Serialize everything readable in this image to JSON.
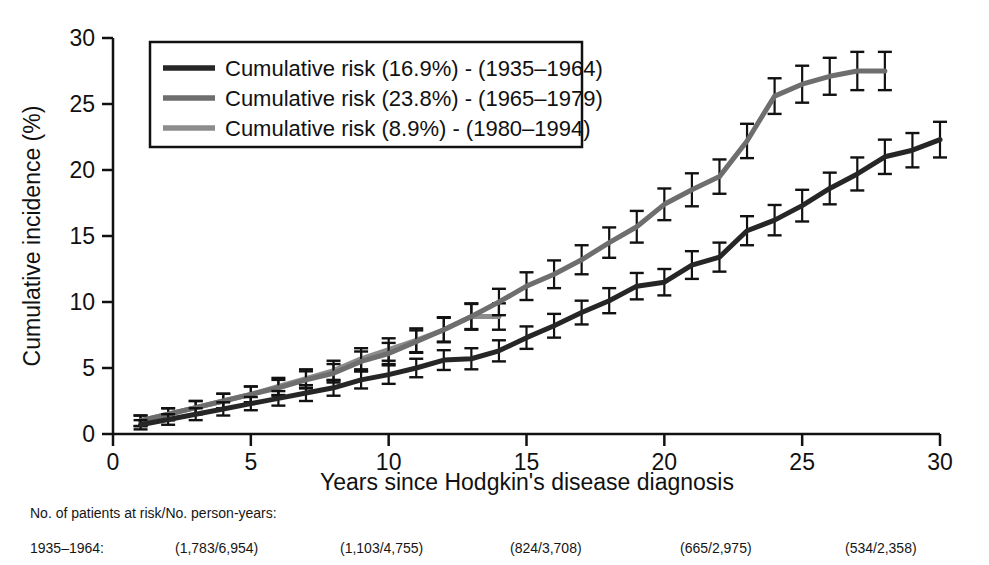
{
  "chart_data": {
    "type": "line",
    "title": "",
    "xlabel": "Years since Hodgkin's disease diagnosis",
    "ylabel": "Cumulative incidence (%)",
    "xlim": [
      0,
      30
    ],
    "ylim": [
      0,
      30
    ],
    "xticks": [
      0,
      5,
      10,
      15,
      20,
      25,
      30
    ],
    "yticks": [
      0,
      5,
      10,
      15,
      20,
      25,
      30
    ],
    "grid": false,
    "legend_position": "top-left",
    "error_bars": true,
    "series": [
      {
        "name": "Cumulative risk (16.9%) - (1935–1964)",
        "color": "#262626",
        "x": [
          1,
          2,
          3,
          4,
          5,
          6,
          7,
          8,
          9,
          10,
          11,
          12,
          13,
          14,
          15,
          16,
          17,
          18,
          19,
          20,
          21,
          22,
          23,
          24,
          25,
          26,
          27,
          28,
          29,
          30
        ],
        "values": [
          0.7,
          1.1,
          1.5,
          1.9,
          2.3,
          2.7,
          3.1,
          3.5,
          4.1,
          4.5,
          5.0,
          5.6,
          5.7,
          6.3,
          7.3,
          8.2,
          9.2,
          10.1,
          11.2,
          11.5,
          12.8,
          13.4,
          15.4,
          16.2,
          17.3,
          18.6,
          19.7,
          21.0,
          21.5,
          22.3
        ],
        "err": [
          0.35,
          0.4,
          0.45,
          0.5,
          0.5,
          0.55,
          0.6,
          0.6,
          0.65,
          0.7,
          0.7,
          0.75,
          0.8,
          0.8,
          0.85,
          0.9,
          0.9,
          0.95,
          1.0,
          1.0,
          1.05,
          1.1,
          1.1,
          1.15,
          1.2,
          1.2,
          1.25,
          1.3,
          1.3,
          1.35
        ]
      },
      {
        "name": "Cumulative risk (23.8%) - (1965–1979)",
        "color": "#6e6e6e",
        "x": [
          1,
          2,
          3,
          4,
          5,
          6,
          7,
          8,
          9,
          10,
          11,
          12,
          13,
          14,
          15,
          16,
          17,
          18,
          19,
          20,
          21,
          22,
          23,
          24,
          25,
          26,
          27,
          28
        ],
        "values": [
          1.0,
          1.5,
          2.0,
          2.5,
          3.0,
          3.5,
          4.1,
          4.6,
          5.5,
          6.1,
          7.0,
          7.9,
          8.9,
          10.0,
          11.2,
          12.1,
          13.2,
          14.5,
          15.7,
          17.4,
          18.5,
          19.5,
          22.2,
          25.6,
          26.5,
          27.1,
          27.5,
          27.5
        ],
        "err": [
          0.4,
          0.45,
          0.5,
          0.55,
          0.6,
          0.6,
          0.65,
          0.7,
          0.75,
          0.8,
          0.85,
          0.9,
          0.95,
          1.0,
          1.05,
          1.05,
          1.1,
          1.15,
          1.2,
          1.2,
          1.25,
          1.3,
          1.3,
          1.35,
          1.4,
          1.4,
          1.45,
          1.45
        ]
      },
      {
        "name": "Cumulative risk (8.9%) - (1980–1994)",
        "color": "#8c8c8c",
        "x": [
          1,
          2,
          3,
          4,
          5,
          6,
          7,
          8,
          9,
          10,
          11,
          12,
          13,
          14
        ],
        "values": [
          1.0,
          1.5,
          2.0,
          2.5,
          3.0,
          3.6,
          4.2,
          4.8,
          5.7,
          6.4,
          7.1,
          7.9,
          8.9,
          8.9
        ],
        "err": [
          0.4,
          0.45,
          0.5,
          0.55,
          0.6,
          0.65,
          0.7,
          0.75,
          0.8,
          0.85,
          0.9,
          0.95,
          1.0,
          1.0
        ]
      }
    ]
  },
  "footnote": {
    "title": "No. of patients at risk/No. person-years:",
    "rows": [
      {
        "label": "1935–1964:",
        "cells": [
          "(1,783/6,954)",
          "(1,103/4,755)",
          "(824/3,708)",
          "(665/2,975)",
          "(534/2,358)",
          "(344/1,734)"
        ]
      }
    ]
  }
}
